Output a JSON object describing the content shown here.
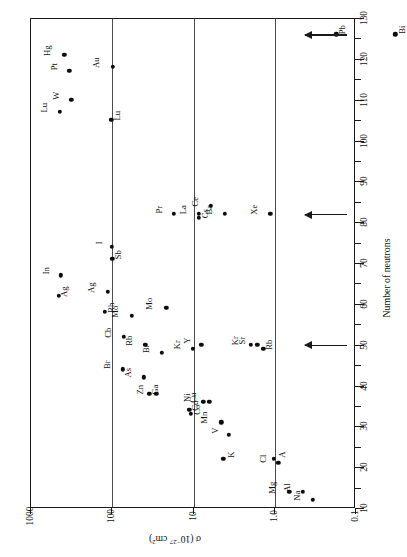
{
  "chart_data": {
    "type": "scatter",
    "title": "",
    "xlabel": "Number of neutrons",
    "ylabel": "σ (10⁻²⁷ cm²)",
    "ylabel_plain": "sigma (10^-27 cm^2)",
    "orientation": "rotated-90",
    "xlim": [
      10,
      130
    ],
    "ylim": [
      0.1,
      1000
    ],
    "yscale": "log",
    "xticks_major": [
      10,
      20,
      30,
      40,
      50,
      60,
      70,
      80,
      90,
      100,
      110,
      120,
      130
    ],
    "xtick_step_minor": 5,
    "ytick_labels": [
      "1000",
      "100",
      "10",
      "1.0",
      "0.1"
    ],
    "ytick_values": [
      1000,
      100,
      10,
      1.0,
      0.1
    ],
    "grid": "vertical-decades",
    "legend": "none",
    "annotations": [
      {
        "type": "arrow",
        "at_x": 126,
        "label": "magic number 126",
        "direction": "left"
      },
      {
        "type": "arrow",
        "at_x": 82,
        "label": "magic number 82",
        "direction": "left"
      },
      {
        "type": "arrow",
        "at_x": 50,
        "label": "magic number 50",
        "direction": "left"
      }
    ],
    "points": [
      {
        "label": "Bi",
        "n": 126,
        "sigma": 0.032,
        "lab_side": "below"
      },
      {
        "label": "Pb",
        "n": 126,
        "sigma": 0.17,
        "lab_side": "below"
      },
      {
        "label": "Hg",
        "n": 121,
        "sigma": 380,
        "lab_side": "above"
      },
      {
        "label": "Au",
        "n": 118,
        "sigma": 96,
        "lab_side": "above"
      },
      {
        "label": "Pt",
        "n": 117,
        "sigma": 330,
        "lab_side": "above"
      },
      {
        "label": "W",
        "n": 110,
        "sigma": 310,
        "lab_side": "above"
      },
      {
        "label": "Lu",
        "n": 105,
        "sigma": 100,
        "lab_side": "below"
      },
      {
        "label": "Lu",
        "n": 107,
        "sigma": 430,
        "lab_side": "above"
      },
      {
        "label": "Ce",
        "n": 84,
        "sigma": 6.0,
        "lab_side": "above"
      },
      {
        "label": "Ba",
        "n": 82,
        "sigma": 4.0,
        "lab_side": "above"
      },
      {
        "label": "La",
        "n": 82,
        "sigma": 8.3,
        "lab_side": "above"
      },
      {
        "label": "Cs",
        "n": 81,
        "sigma": 8.3,
        "lab_side": "below"
      },
      {
        "label": "Pr",
        "n": 82,
        "sigma": 17,
        "lab_side": "above"
      },
      {
        "label": "Xe",
        "n": 82,
        "sigma": 1.1,
        "lab_side": "above"
      },
      {
        "label": "I",
        "n": 74,
        "sigma": 98,
        "lab_side": "above"
      },
      {
        "label": "Sb",
        "n": 71,
        "sigma": 97,
        "lab_side": "below"
      },
      {
        "label": "In",
        "n": 67,
        "sigma": 420,
        "lab_side": "above"
      },
      {
        "label": "Ag",
        "n": 62,
        "sigma": 440,
        "lab_side": "below"
      },
      {
        "label": "Ag",
        "n": 63,
        "sigma": 110,
        "lab_side": "above"
      },
      {
        "label": "Rh",
        "n": 58,
        "sigma": 120,
        "lab_side": "below"
      },
      {
        "label": "Mo",
        "n": 57,
        "sigma": 56,
        "lab_side": "above"
      },
      {
        "label": "Mo",
        "n": 59,
        "sigma": 21,
        "lab_side": "above"
      },
      {
        "label": "Cb",
        "n": 52,
        "sigma": 70,
        "lab_side": "above"
      },
      {
        "label": "Rb",
        "n": 50,
        "sigma": 38,
        "lab_side": "above"
      },
      {
        "label": "Br",
        "n": 48,
        "sigma": 24,
        "lab_side": "above"
      },
      {
        "label": "Kr",
        "n": 49,
        "sigma": 10,
        "lab_side": "above"
      },
      {
        "label": "Y",
        "n": 50,
        "sigma": 7.8,
        "lab_side": "above"
      },
      {
        "label": "Kr",
        "n": 50,
        "sigma": 1.9,
        "lab_side": "above"
      },
      {
        "label": "Sr",
        "n": 50,
        "sigma": 1.6,
        "lab_side": "above"
      },
      {
        "label": "Rb",
        "n": 49,
        "sigma": 1.35,
        "lab_side": "below"
      },
      {
        "label": "Br",
        "n": 44,
        "sigma": 72,
        "lab_side": "above"
      },
      {
        "label": "As",
        "n": 42,
        "sigma": 40,
        "lab_side": "above"
      },
      {
        "label": "Ga",
        "n": 38,
        "sigma": 34,
        "lab_side": "below"
      },
      {
        "label": "Zn",
        "n": 38,
        "sigma": 28,
        "lab_side": "above"
      },
      {
        "label": "Ni",
        "n": 36,
        "sigma": 7.4,
        "lab_side": "above"
      },
      {
        "label": "Cu",
        "n": 36,
        "sigma": 6.2,
        "lab_side": "above"
      },
      {
        "label": "Cu",
        "n": 34,
        "sigma": 11,
        "lab_side": "below"
      },
      {
        "label": "Co",
        "n": 33,
        "sigma": 10.5,
        "lab_side": "below"
      },
      {
        "label": "Mn",
        "n": 31,
        "sigma": 4.4,
        "lab_side": "above"
      },
      {
        "label": "V",
        "n": 28,
        "sigma": 3.6,
        "lab_side": "above"
      },
      {
        "label": "K",
        "n": 22,
        "sigma": 4.2,
        "lab_side": "below"
      },
      {
        "label": "A",
        "n": 22,
        "sigma": 1.0,
        "lab_side": "below"
      },
      {
        "label": "Cl",
        "n": 21,
        "sigma": 0.88,
        "lab_side": "above"
      },
      {
        "label": "Mg",
        "n": 14,
        "sigma": 0.64,
        "lab_side": "above"
      },
      {
        "label": "Al",
        "n": 14,
        "sigma": 0.44,
        "lab_side": "above"
      },
      {
        "label": "Na",
        "n": 12,
        "sigma": 0.33,
        "lab_side": "above"
      }
    ]
  },
  "axes": {
    "neutron_title": "Number of neutrons",
    "sigma_title_prefix": "σ (10",
    "sigma_title_exp": "−27",
    "sigma_title_suffix": " cm",
    "sigma_title_exp2": "2",
    "sigma_title_close": ")"
  },
  "colors": {
    "frame": "#1a1a1a",
    "gridline": "#4d4d4d",
    "point": "#0d0d0d",
    "background": "#ffffff"
  }
}
